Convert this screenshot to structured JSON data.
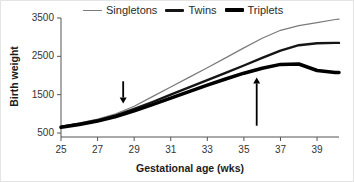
{
  "figure": {
    "background": "#ffffff",
    "axis_color": "#555555",
    "tick_text_color": "#333333"
  },
  "chart_data": {
    "type": "line",
    "title": "",
    "xlabel": "Gestational age (wks)",
    "ylabel": "Birth weight",
    "xlim": [
      25,
      40.2
    ],
    "ylim": [
      500,
      3500
    ],
    "x_ticks": [
      25,
      27,
      29,
      31,
      33,
      35,
      37,
      39
    ],
    "y_ticks": [
      500,
      1500,
      2500,
      3500
    ],
    "grid": false,
    "legend_position": "top",
    "x": [
      25,
      26,
      27,
      28,
      29,
      30,
      31,
      32,
      33,
      34,
      35,
      36,
      37,
      38,
      39,
      40,
      40.2
    ],
    "series": [
      {
        "name": "Singletons",
        "color": "#7a7a7a",
        "stroke_width": 1.2,
        "values": [
          680,
          760,
          860,
          1000,
          1200,
          1450,
          1700,
          1950,
          2200,
          2460,
          2720,
          2970,
          3180,
          3300,
          3380,
          3460,
          3470
        ]
      },
      {
        "name": "Twins",
        "color": "#151515",
        "stroke_width": 2.4,
        "values": [
          660,
          740,
          830,
          960,
          1130,
          1310,
          1500,
          1690,
          1880,
          2070,
          2260,
          2460,
          2650,
          2790,
          2840,
          2850,
          2850
        ]
      },
      {
        "name": "Triplets",
        "color": "#000000",
        "stroke_width": 3.5,
        "values": [
          650,
          720,
          810,
          930,
          1080,
          1240,
          1410,
          1580,
          1750,
          1910,
          2060,
          2190,
          2290,
          2300,
          2130,
          2080,
          2080
        ]
      }
    ],
    "annotations": [
      {
        "name": "divergence-arrow",
        "shape": "arrow-down",
        "week": 28.4,
        "from_g": 1850,
        "to_g": 1270
      },
      {
        "name": "triplet-plateau-arrow",
        "shape": "arrow-up",
        "week": 35.7,
        "from_g": 690,
        "to_g": 1950
      }
    ]
  }
}
